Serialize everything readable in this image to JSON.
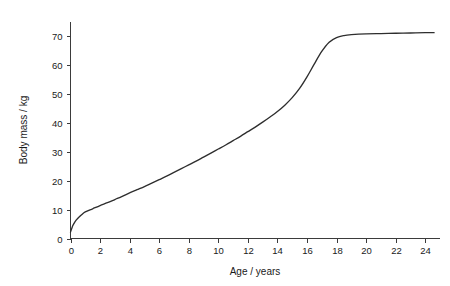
{
  "chart_data": {
    "type": "line",
    "title": "",
    "subtitle": "",
    "xlabel": "Age / years",
    "ylabel": "Body mass / kg",
    "xlim": [
      0,
      25
    ],
    "ylim": [
      0,
      75
    ],
    "xticks": [
      0,
      2,
      4,
      6,
      8,
      10,
      12,
      14,
      16,
      18,
      20,
      22,
      24
    ],
    "yticks": [
      0,
      10,
      20,
      30,
      40,
      50,
      60,
      70
    ],
    "xtick_labels": [
      "0",
      "2",
      "4",
      "6",
      "8",
      "10",
      "12",
      "14",
      "16",
      "18",
      "20",
      "22",
      "24"
    ],
    "ytick_labels": [
      "0",
      "10",
      "20",
      "30",
      "40",
      "50",
      "60",
      "70"
    ],
    "grid": false,
    "legend": false,
    "legend_position": "none",
    "line_color": "#2e2e2e",
    "background_color": "#ffffff",
    "axis_color": "#3b3b3b",
    "series": [
      {
        "name": "Body mass",
        "x": [
          0,
          0.15,
          0.3,
          0.5,
          0.75,
          1,
          1.5,
          2,
          2.5,
          3,
          3.5,
          4,
          4.5,
          5,
          5.5,
          6,
          6.5,
          7,
          7.5,
          8,
          8.5,
          9,
          9.5,
          10,
          10.5,
          11,
          11.5,
          12,
          12.5,
          13,
          13.5,
          14,
          14.5,
          15,
          15.5,
          16,
          16.5,
          17,
          17.5,
          18,
          18.5,
          19,
          20,
          21,
          22,
          23,
          24,
          24.6
        ],
        "y": [
          2.2,
          4.4,
          5.8,
          7.0,
          8.2,
          9.2,
          10.3,
          11.4,
          12.4,
          13.5,
          14.6,
          15.8,
          16.9,
          18.0,
          19.2,
          20.4,
          21.6,
          22.9,
          24.2,
          25.5,
          26.8,
          28.2,
          29.6,
          31.0,
          32.4,
          33.9,
          35.4,
          37.0,
          38.6,
          40.3,
          42.1,
          44.0,
          46.2,
          48.8,
          52.0,
          56.0,
          60.5,
          64.8,
          68.0,
          69.6,
          70.3,
          70.6,
          70.9,
          71.0,
          71.1,
          71.2,
          71.3,
          71.3
        ]
      }
    ]
  }
}
